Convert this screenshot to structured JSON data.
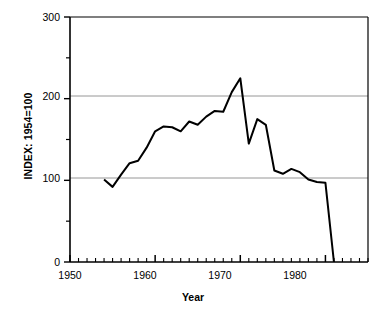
{
  "chart_data": {
    "type": "line",
    "title": "",
    "xlabel": "Year",
    "ylabel": "INDEX: 1954=100",
    "xlim": [
      1950,
      1985
    ],
    "ylim": [
      0,
      300
    ],
    "grid": "horizontal gridlines at y=100 and y=200 only",
    "legend": "none",
    "x_major_ticks": [
      1950,
      1960,
      1970,
      1980
    ],
    "x_major_tick_labels": [
      "1950",
      "1960",
      "1970",
      "1980"
    ],
    "x_minor_tick_interval": 1,
    "y_major_ticks": [
      0,
      100,
      200,
      300
    ],
    "y_major_tick_labels": [
      "0",
      "100",
      "200",
      "300"
    ],
    "y_minor_ticks": [
      50,
      150,
      250
    ],
    "series": [
      {
        "name": "index",
        "color": "#000000",
        "x": [
          1954,
          1955,
          1956,
          1957,
          1958,
          1959,
          1960,
          1961,
          1962,
          1963,
          1964,
          1965,
          1966,
          1967,
          1968,
          1969,
          1970,
          1971,
          1972,
          1973,
          1974,
          1975,
          1976,
          1977,
          1978,
          1979,
          1980,
          1981
        ],
        "y": [
          101,
          92,
          107,
          121,
          124,
          140,
          160,
          166,
          165,
          160,
          172,
          168,
          178,
          185,
          184,
          208,
          225,
          145,
          175,
          168,
          112,
          108,
          114,
          110,
          101,
          98,
          97,
          0
        ]
      }
    ]
  },
  "axis_titles": {
    "x": "Year",
    "y": "INDEX: 1954=100"
  }
}
